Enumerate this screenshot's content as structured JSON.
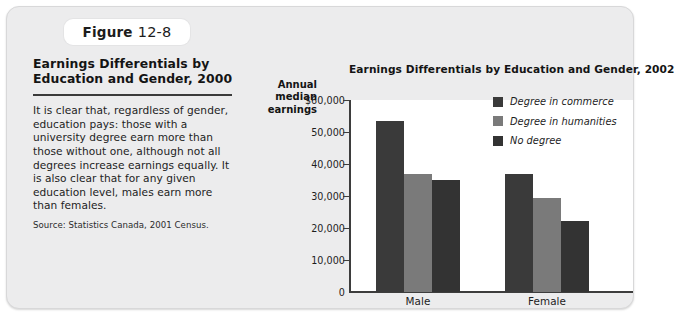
{
  "figure": {
    "badge_label": "Figure",
    "badge_number": "12-8",
    "heading": "Earnings Differentials by\nEducation and Gender, 2000",
    "body": "It is clear that, regardless of gender, education pays: those with a university degree earn more than those without one, although not all degrees increase earnings equally. It is also clear that for any given education level, males earn more than females.",
    "source": "Source: Statistics Canada, 2001 Census."
  },
  "colors": {
    "panel_background": "#ececed",
    "plot_background": "#ffffff",
    "axis": "#3d3d3d",
    "series_commerce": "#3a3a3a",
    "series_humanities": "#7a7a7a",
    "series_no_degree": "#333333"
  },
  "chart_data": {
    "type": "bar",
    "title": "Earnings Differentials by Education and Gender, 2002",
    "ylabel": "Annual median earnings",
    "xlabel": "",
    "categories": [
      "Male",
      "Female"
    ],
    "series": [
      {
        "name": "Degree in commerce",
        "color": "#3a3a3a",
        "values": [
          53500,
          37000
        ]
      },
      {
        "name": "Degree in humanities",
        "color": "#7a7a7a",
        "values": [
          36800,
          29400
        ]
      },
      {
        "name": "No degree",
        "color": "#333333",
        "values": [
          35000,
          22300
        ]
      }
    ],
    "ylim": [
      0,
      60000
    ],
    "yticks": [
      0,
      10000,
      20000,
      30000,
      40000,
      50000,
      60000
    ],
    "ytick_labels": [
      "0",
      "10,000",
      "20,000",
      "30,000",
      "40,000",
      "50,000",
      "$60,000"
    ],
    "grid": false,
    "legend_position": "top-right"
  }
}
